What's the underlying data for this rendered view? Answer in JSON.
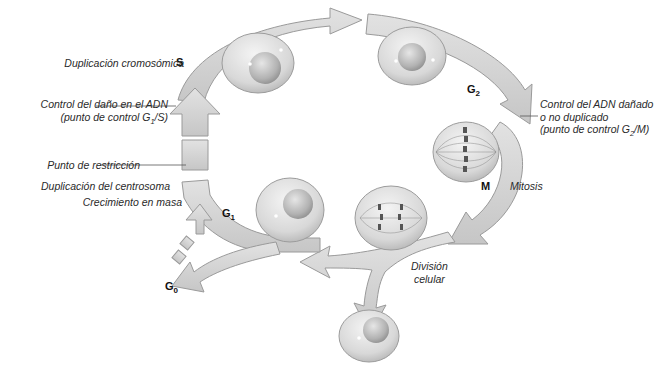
{
  "diagram": {
    "colors": {
      "arrow_fill": "#d3d3d3",
      "arrow_stroke": "#9a9a9a",
      "arrow_shadow": "#b8b8b8",
      "cell_fill": "#dcdcdc",
      "cell_stroke": "#9c9c9c",
      "nucleus_fill": "#bdbdbd",
      "chromosome": "#555555",
      "leader_line": "#555555",
      "text": "#2a2a2a"
    },
    "phases": {
      "s": {
        "label": "S"
      },
      "g2": {
        "label": "G",
        "sub": "2"
      },
      "m": {
        "label": "M"
      },
      "g1": {
        "label": "G",
        "sub": "1"
      },
      "g0": {
        "label": "G",
        "sub": "0"
      }
    },
    "labels": {
      "duplicacion_cromosomica": "Duplicación cromosómica",
      "control_dano_line1": "Control del daño en el ADN",
      "control_dano_line2_pre": "(punto de control G",
      "control_dano_line2_sub": "1",
      "control_dano_line2_post": "/S)",
      "punto_restriccion": "Punto de restricción",
      "duplicacion_centrosoma": "Duplicación del centrosoma",
      "crecimiento_masa": "Crecimiento en masa",
      "control_adn_line1": "Control del ADN dañado",
      "control_adn_line2": "o no duplicado",
      "control_adn_line3_pre": "(punto de control G",
      "control_adn_line3_sub": "2",
      "control_adn_line3_post": "/M)",
      "mitosis": "Mitosis",
      "division_line1": "División",
      "division_line2": "celular"
    }
  }
}
